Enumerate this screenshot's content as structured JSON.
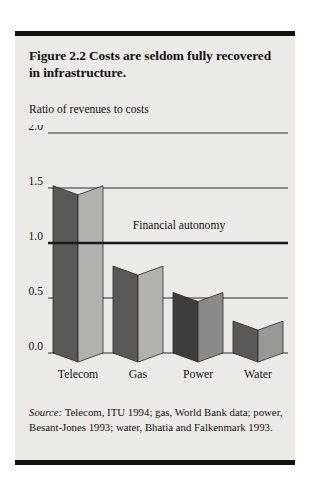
{
  "figure": {
    "title": "Figure 2.2  Costs are seldom fully recovered in infrastructure.",
    "axis_caption": "Ratio of revenues to costs",
    "source_lead": "Source:",
    "source_text": " Telecom, ITU 1994; gas, World Bank data; power, Besant-Jones 1993; water, Bhatia and Falkenmark 1993."
  },
  "chart_data": {
    "type": "bar",
    "title": "Costs are seldom fully recovered in infrastructure.",
    "xlabel": "",
    "ylabel": "Ratio of revenues to costs",
    "categories": [
      "Telecom",
      "Gas",
      "Power",
      "Water"
    ],
    "values": [
      1.52,
      0.79,
      0.55,
      0.29
    ],
    "ylim": [
      0.0,
      2.0
    ],
    "yticks": [
      0.0,
      0.5,
      1.0,
      1.5,
      2.0
    ],
    "ytick_labels": [
      "0.0",
      "0.5",
      "1.0",
      "1.5",
      "2.0"
    ],
    "grid": true,
    "legend": "none",
    "annotations": [
      {
        "text": "Financial autonomy",
        "y": 1.0,
        "note": "threshold line drawn heavier at ratio 1.0"
      }
    ],
    "bar_style": "3d-prism",
    "bar_colors_left": [
      "#595959",
      "#595959",
      "#3d3d3d",
      "#595959"
    ],
    "bar_colors_right": [
      "#b3b1ad",
      "#b3b1ad",
      "#8a8a8a",
      "#9a9894"
    ],
    "bar_colors_top": [
      "#9e9c98",
      "#9e9c98",
      "#6e6e6e",
      "#8e8c88"
    ],
    "colors": {
      "panel_background": "#eceae6",
      "rule": "#111111",
      "gridline": "#6b6b6b",
      "threshold_line": "#1a1a1a",
      "text": "#141414"
    }
  }
}
